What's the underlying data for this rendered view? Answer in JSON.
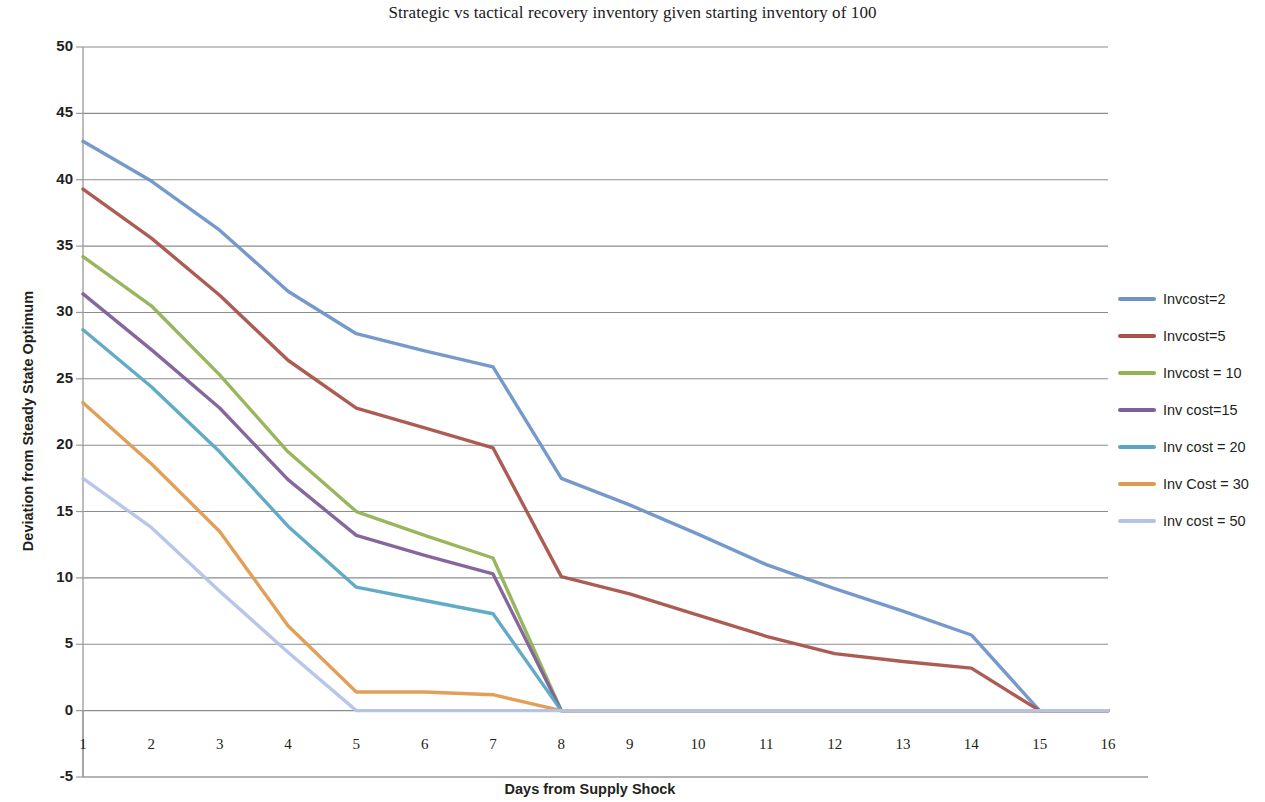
{
  "chart_data": {
    "type": "line",
    "title": "Strategic vs tactical recovery inventory given starting inventory of 100",
    "xlabel": "Days from Supply Shock",
    "ylabel": "Deviation from Steady State Optimum",
    "x": [
      1,
      2,
      3,
      4,
      5,
      6,
      7,
      8,
      9,
      10,
      11,
      12,
      13,
      14,
      15,
      16
    ],
    "categories": [
      "1",
      "2",
      "3",
      "4",
      "5",
      "6",
      "7",
      "8",
      "9",
      "10",
      "11",
      "12",
      "13",
      "14",
      "15",
      "16"
    ],
    "xlim": [
      1,
      16
    ],
    "ylim": [
      -5,
      50
    ],
    "yticks": [
      -5,
      0,
      5,
      10,
      15,
      20,
      25,
      30,
      35,
      40,
      45,
      50
    ],
    "ytick_labels": [
      "-5",
      "0",
      "5",
      "10",
      "15",
      "20",
      "25",
      "30",
      "35",
      "40",
      "45",
      "50"
    ],
    "grid": "horizontal",
    "legend_position": "right",
    "series": [
      {
        "name": "Invcost=2",
        "color": "#6f93c9",
        "values": [
          42.9,
          39.9,
          36.2,
          31.6,
          28.4,
          27.1,
          25.9,
          17.5,
          15.5,
          13.3,
          11.0,
          9.2,
          7.5,
          5.7,
          0.0,
          0.0
        ]
      },
      {
        "name": "Invcost=5",
        "color": "#a8534a",
        "values": [
          39.3,
          35.6,
          31.3,
          26.4,
          22.8,
          21.3,
          19.8,
          10.1,
          8.8,
          7.2,
          5.6,
          4.3,
          3.7,
          3.2,
          0.0,
          0.0
        ]
      },
      {
        "name": "Invcost = 10",
        "color": "#92b255",
        "values": [
          34.2,
          30.5,
          25.3,
          19.5,
          15.0,
          13.2,
          11.5,
          0.0,
          0.0,
          0.0,
          0.0,
          0.0,
          0.0,
          0.0,
          0.0,
          0.0
        ]
      },
      {
        "name": "Inv cost=15",
        "color": "#7e5f98",
        "values": [
          31.4,
          27.2,
          22.8,
          17.4,
          13.2,
          11.7,
          10.3,
          0.0,
          0.0,
          0.0,
          0.0,
          0.0,
          0.0,
          0.0,
          0.0,
          0.0
        ]
      },
      {
        "name": "Inv cost = 20",
        "color": "#5aa6c4",
        "values": [
          28.7,
          24.4,
          19.5,
          13.9,
          9.3,
          8.3,
          7.3,
          0.0,
          0.0,
          0.0,
          0.0,
          0.0,
          0.0,
          0.0,
          0.0,
          0.0
        ]
      },
      {
        "name": "Inv Cost = 30",
        "color": "#e09a4e",
        "values": [
          23.2,
          18.6,
          13.5,
          6.4,
          1.4,
          1.4,
          1.2,
          0.0,
          0.0,
          0.0,
          0.0,
          0.0,
          0.0,
          0.0,
          0.0,
          0.0
        ]
      },
      {
        "name": "Inv cost = 50",
        "color": "#b4c4e8",
        "values": [
          17.5,
          13.8,
          9.0,
          4.4,
          0.0,
          0.0,
          0.0,
          0.0,
          0.0,
          0.0,
          0.0,
          0.0,
          0.0,
          0.0,
          0.0,
          0.0
        ]
      }
    ]
  }
}
